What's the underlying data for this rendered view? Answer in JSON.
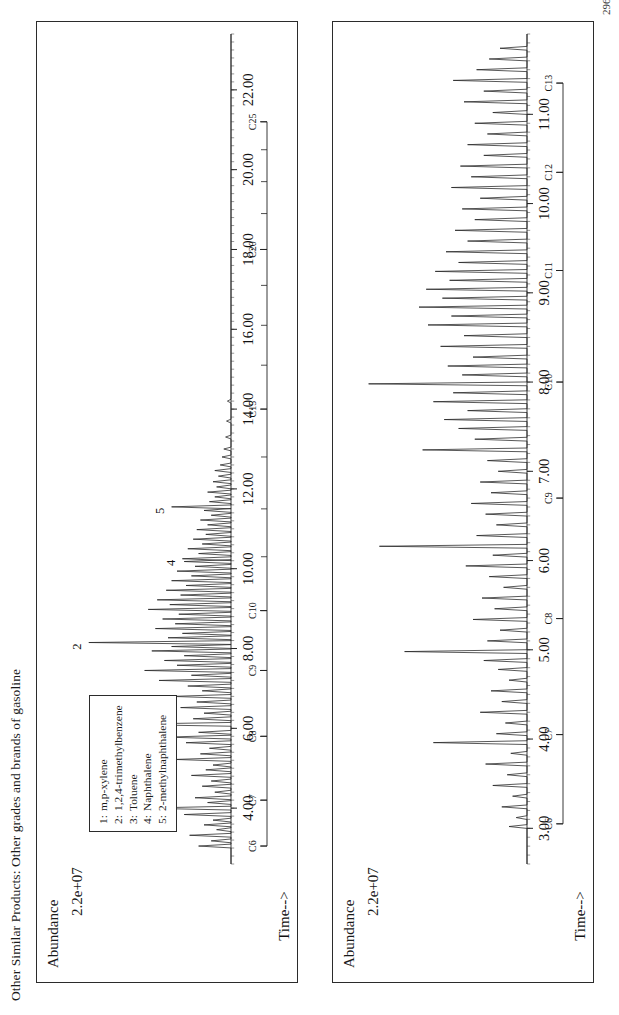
{
  "page": {
    "header": "Other Similar Products:  Other grades and brands of gasoline",
    "number": "296"
  },
  "legend": {
    "entries": [
      {
        "n": "1:",
        "label": "m,p-xylene"
      },
      {
        "n": "2:",
        "label": "1,2,4-trimethylbenzene"
      },
      {
        "n": "3:",
        "label": "Toluene"
      },
      {
        "n": "4:",
        "label": "Naphthalene"
      },
      {
        "n": "5:",
        "label": "2-methylnaphthalene"
      }
    ]
  },
  "chart_data": [
    {
      "id": "top",
      "type": "line",
      "title": "",
      "xlabel": "Time-->",
      "ylabel": "Abundance",
      "y_tick_label": "2.2e+07",
      "xlim": [
        2.6,
        23.4
      ],
      "ylim": [
        0,
        1
      ],
      "grid": false,
      "x_ticks": [
        "4.00",
        "6.00",
        "8.00",
        "10.00",
        "12.00",
        "14.00",
        "16.00",
        "18.00",
        "20.00",
        "22.00"
      ],
      "x_tick_values": [
        4,
        6,
        8,
        10,
        12,
        14,
        16,
        18,
        20,
        22
      ],
      "carbon_markers": [
        {
          "label": "C6",
          "x": 3.05
        },
        {
          "label": "C7",
          "x": 4.2
        },
        {
          "label": "C8",
          "x": 5.8
        },
        {
          "label": "C9",
          "x": 7.45
        },
        {
          "label": "C10",
          "x": 8.95
        },
        {
          "label": "C15",
          "x": 14.0
        },
        {
          "label": "C20",
          "x": 18.0
        },
        {
          "label": "C25",
          "x": 21.2
        }
      ],
      "carbon_minor_ticks": [
        3.05,
        4.2,
        5.8,
        7.45,
        8.95,
        10.3,
        11.5,
        12.8,
        14.0,
        15.1,
        16.1,
        17.1,
        18.0,
        18.9,
        19.7,
        20.5,
        21.2
      ],
      "peak_labels": [
        {
          "label": "1",
          "x": 6.1,
          "y": 0.63
        },
        {
          "label": "2",
          "x": 8.15,
          "y": 0.8
        },
        {
          "label": "3",
          "x": 4.0,
          "y": 0.49
        },
        {
          "label": "4",
          "x": 10.25,
          "y": 0.28
        },
        {
          "label": "5",
          "x": 11.55,
          "y": 0.34
        }
      ],
      "peaks": [
        {
          "x": 3.05,
          "h": 0.18
        },
        {
          "x": 3.18,
          "h": 0.11
        },
        {
          "x": 3.32,
          "h": 0.23
        },
        {
          "x": 3.46,
          "h": 0.08
        },
        {
          "x": 3.58,
          "h": 0.15
        },
        {
          "x": 3.7,
          "h": 0.1
        },
        {
          "x": 3.84,
          "h": 0.26
        },
        {
          "x": 4.0,
          "h": 0.49
        },
        {
          "x": 4.14,
          "h": 0.13
        },
        {
          "x": 4.26,
          "h": 0.2
        },
        {
          "x": 4.4,
          "h": 0.09
        },
        {
          "x": 4.55,
          "h": 0.16
        },
        {
          "x": 4.68,
          "h": 0.11
        },
        {
          "x": 4.82,
          "h": 0.22
        },
        {
          "x": 4.96,
          "h": 0.14
        },
        {
          "x": 5.08,
          "h": 0.1
        },
        {
          "x": 5.22,
          "h": 0.31
        },
        {
          "x": 5.36,
          "h": 0.17
        },
        {
          "x": 5.5,
          "h": 0.12
        },
        {
          "x": 5.64,
          "h": 0.25
        },
        {
          "x": 5.78,
          "h": 0.36
        },
        {
          "x": 5.9,
          "h": 0.18
        },
        {
          "x": 6.1,
          "h": 0.62
        },
        {
          "x": 6.24,
          "h": 0.21
        },
        {
          "x": 6.38,
          "h": 0.15
        },
        {
          "x": 6.52,
          "h": 0.28
        },
        {
          "x": 6.66,
          "h": 0.19
        },
        {
          "x": 6.8,
          "h": 0.33
        },
        {
          "x": 6.94,
          "h": 0.16
        },
        {
          "x": 7.06,
          "h": 0.24
        },
        {
          "x": 7.2,
          "h": 0.4
        },
        {
          "x": 7.33,
          "h": 0.22
        },
        {
          "x": 7.45,
          "h": 0.48
        },
        {
          "x": 7.58,
          "h": 0.3
        },
        {
          "x": 7.7,
          "h": 0.37
        },
        {
          "x": 7.82,
          "h": 0.26
        },
        {
          "x": 7.94,
          "h": 0.44
        },
        {
          "x": 8.05,
          "h": 0.33
        },
        {
          "x": 8.15,
          "h": 0.79
        },
        {
          "x": 8.27,
          "h": 0.35
        },
        {
          "x": 8.38,
          "h": 0.27
        },
        {
          "x": 8.5,
          "h": 0.42
        },
        {
          "x": 8.62,
          "h": 0.31
        },
        {
          "x": 8.74,
          "h": 0.38
        },
        {
          "x": 8.86,
          "h": 0.29
        },
        {
          "x": 8.98,
          "h": 0.46
        },
        {
          "x": 9.1,
          "h": 0.34
        },
        {
          "x": 9.22,
          "h": 0.41
        },
        {
          "x": 9.34,
          "h": 0.28
        },
        {
          "x": 9.46,
          "h": 0.36
        },
        {
          "x": 9.58,
          "h": 0.25
        },
        {
          "x": 9.7,
          "h": 0.33
        },
        {
          "x": 9.82,
          "h": 0.22
        },
        {
          "x": 9.94,
          "h": 0.3
        },
        {
          "x": 10.06,
          "h": 0.2
        },
        {
          "x": 10.18,
          "h": 0.26
        },
        {
          "x": 10.25,
          "h": 0.27
        },
        {
          "x": 10.38,
          "h": 0.18
        },
        {
          "x": 10.5,
          "h": 0.24
        },
        {
          "x": 10.62,
          "h": 0.16
        },
        {
          "x": 10.74,
          "h": 0.21
        },
        {
          "x": 10.86,
          "h": 0.14
        },
        {
          "x": 10.98,
          "h": 0.19
        },
        {
          "x": 11.1,
          "h": 0.13
        },
        {
          "x": 11.22,
          "h": 0.17
        },
        {
          "x": 11.34,
          "h": 0.11
        },
        {
          "x": 11.46,
          "h": 0.15
        },
        {
          "x": 11.55,
          "h": 0.33
        },
        {
          "x": 11.68,
          "h": 0.12
        },
        {
          "x": 11.8,
          "h": 0.09
        },
        {
          "x": 11.92,
          "h": 0.13
        },
        {
          "x": 12.05,
          "h": 0.08
        },
        {
          "x": 12.18,
          "h": 0.1
        },
        {
          "x": 12.32,
          "h": 0.07
        },
        {
          "x": 12.46,
          "h": 0.09
        },
        {
          "x": 12.6,
          "h": 0.06
        },
        {
          "x": 12.8,
          "h": 0.05
        },
        {
          "x": 13.0,
          "h": 0.04
        },
        {
          "x": 13.3,
          "h": 0.03
        },
        {
          "x": 13.7,
          "h": 0.025
        },
        {
          "x": 14.2,
          "h": 0.02
        }
      ]
    },
    {
      "id": "bottom",
      "type": "line",
      "title": "",
      "xlabel": "Time-->",
      "ylabel": "Abundance",
      "y_tick_label": "2.2e+07",
      "xlim": [
        2.6,
        11.9
      ],
      "ylim": [
        0,
        1
      ],
      "grid": false,
      "x_ticks": [
        "3.00",
        "4.00",
        "5.00",
        "6.00",
        "7.00",
        "8.00",
        "9.00",
        "10.00",
        "11.00"
      ],
      "x_tick_values": [
        3,
        4,
        5,
        6,
        7,
        8,
        9,
        10,
        11
      ],
      "carbon_markers": [
        {
          "label": "C6",
          "x": 3.05
        },
        {
          "label": "C7",
          "x": 4.05
        },
        {
          "label": "C8",
          "x": 5.35
        },
        {
          "label": "C9",
          "x": 6.7
        },
        {
          "label": "C10",
          "x": 8.0
        },
        {
          "label": "C11",
          "x": 9.25
        },
        {
          "label": "C12",
          "x": 10.35
        },
        {
          "label": "C13",
          "x": 11.35
        }
      ],
      "carbon_minor_ticks": [
        3.05,
        4.05,
        5.35,
        6.7,
        8.0,
        9.25,
        10.35,
        11.35
      ],
      "peak_labels": [],
      "peaks": [
        {
          "x": 3.02,
          "h": 0.1
        },
        {
          "x": 3.12,
          "h": 0.06
        },
        {
          "x": 3.24,
          "h": 0.14
        },
        {
          "x": 3.36,
          "h": 0.08
        },
        {
          "x": 3.48,
          "h": 0.19
        },
        {
          "x": 3.6,
          "h": 0.11
        },
        {
          "x": 3.72,
          "h": 0.23
        },
        {
          "x": 3.84,
          "h": 0.09
        },
        {
          "x": 3.96,
          "h": 0.52
        },
        {
          "x": 4.06,
          "h": 0.17
        },
        {
          "x": 4.18,
          "h": 0.12
        },
        {
          "x": 4.3,
          "h": 0.26
        },
        {
          "x": 4.42,
          "h": 0.14
        },
        {
          "x": 4.54,
          "h": 0.2
        },
        {
          "x": 4.66,
          "h": 0.1
        },
        {
          "x": 4.78,
          "h": 0.16
        },
        {
          "x": 4.88,
          "h": 0.24
        },
        {
          "x": 4.98,
          "h": 0.68
        },
        {
          "x": 5.1,
          "h": 0.22
        },
        {
          "x": 5.22,
          "h": 0.15
        },
        {
          "x": 5.34,
          "h": 0.3
        },
        {
          "x": 5.46,
          "h": 0.18
        },
        {
          "x": 5.58,
          "h": 0.25
        },
        {
          "x": 5.7,
          "h": 0.13
        },
        {
          "x": 5.82,
          "h": 0.21
        },
        {
          "x": 5.94,
          "h": 0.34
        },
        {
          "x": 6.06,
          "h": 0.19
        },
        {
          "x": 6.16,
          "h": 0.82
        },
        {
          "x": 6.28,
          "h": 0.28
        },
        {
          "x": 6.4,
          "h": 0.17
        },
        {
          "x": 6.52,
          "h": 0.23
        },
        {
          "x": 6.64,
          "h": 0.31
        },
        {
          "x": 6.76,
          "h": 0.2
        },
        {
          "x": 6.88,
          "h": 0.26
        },
        {
          "x": 7.0,
          "h": 0.16
        },
        {
          "x": 7.12,
          "h": 0.22
        },
        {
          "x": 7.24,
          "h": 0.58
        },
        {
          "x": 7.36,
          "h": 0.29
        },
        {
          "x": 7.48,
          "h": 0.38
        },
        {
          "x": 7.58,
          "h": 0.46
        },
        {
          "x": 7.68,
          "h": 0.33
        },
        {
          "x": 7.78,
          "h": 0.52
        },
        {
          "x": 7.88,
          "h": 0.41
        },
        {
          "x": 7.98,
          "h": 0.88
        },
        {
          "x": 8.08,
          "h": 0.36
        },
        {
          "x": 8.18,
          "h": 0.44
        },
        {
          "x": 8.28,
          "h": 0.3
        },
        {
          "x": 8.4,
          "h": 0.48
        },
        {
          "x": 8.52,
          "h": 0.35
        },
        {
          "x": 8.64,
          "h": 0.55
        },
        {
          "x": 8.74,
          "h": 0.42
        },
        {
          "x": 8.84,
          "h": 0.6
        },
        {
          "x": 8.94,
          "h": 0.47
        },
        {
          "x": 9.04,
          "h": 0.56
        },
        {
          "x": 9.14,
          "h": 0.43
        },
        {
          "x": 9.24,
          "h": 0.51
        },
        {
          "x": 9.34,
          "h": 0.38
        },
        {
          "x": 9.46,
          "h": 0.45
        },
        {
          "x": 9.58,
          "h": 0.33
        },
        {
          "x": 9.7,
          "h": 0.4
        },
        {
          "x": 9.82,
          "h": 0.29
        },
        {
          "x": 9.94,
          "h": 0.36
        },
        {
          "x": 10.06,
          "h": 0.26
        },
        {
          "x": 10.18,
          "h": 0.42
        },
        {
          "x": 10.3,
          "h": 0.31
        },
        {
          "x": 10.42,
          "h": 0.37
        },
        {
          "x": 10.54,
          "h": 0.24
        },
        {
          "x": 10.66,
          "h": 0.33
        },
        {
          "x": 10.78,
          "h": 0.22
        },
        {
          "x": 10.9,
          "h": 0.29
        },
        {
          "x": 11.02,
          "h": 0.19
        },
        {
          "x": 11.14,
          "h": 0.35
        },
        {
          "x": 11.26,
          "h": 0.24
        },
        {
          "x": 11.38,
          "h": 0.41
        },
        {
          "x": 11.5,
          "h": 0.28
        },
        {
          "x": 11.62,
          "h": 0.21
        },
        {
          "x": 11.74,
          "h": 0.15
        }
      ]
    }
  ]
}
